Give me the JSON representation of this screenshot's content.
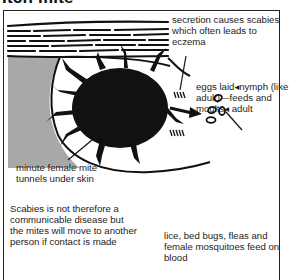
{
  "title": "Itch mite",
  "diagram": {
    "labels": {
      "secretion": "secretion causes scabies which often leads to eczema",
      "life_cycle": "eggs laid◂nymph (like adult)—feeds and moults◂ adult",
      "tunnel": "minute female mite tunnels under skin",
      "communicability": "Scabies is not therefore a communicable disease but the mites will move to another person if contact is made",
      "other_parasites": "lice, bed bugs, fleas and female mosquitoes feed on blood"
    },
    "colors": {
      "ink": "#111111",
      "shading": "#a8a8a8",
      "background": "#ffffff"
    }
  }
}
